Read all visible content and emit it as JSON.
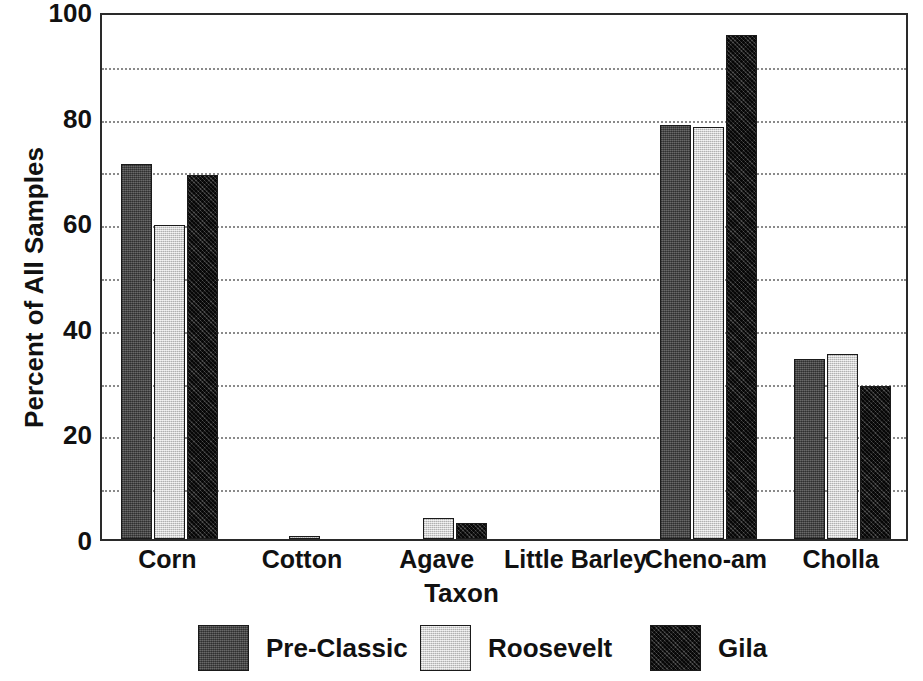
{
  "chart_data": {
    "type": "bar",
    "title": "",
    "xlabel": "Taxon",
    "ylabel": "Percent of All Samples",
    "ylim": [
      0,
      100
    ],
    "yticks": [
      0,
      20,
      40,
      60,
      80,
      100
    ],
    "ytick_labels": [
      "0",
      "20",
      "40",
      "60",
      "80",
      "100"
    ],
    "minor_gridlines": [
      10,
      30,
      50,
      70,
      90
    ],
    "grid": true,
    "grid_style": "dotted",
    "legend_position": "bottom",
    "categories": [
      "Corn",
      "Cotton",
      "Agave",
      "Little Barley",
      "Cheno-am",
      "Cholla"
    ],
    "series": [
      {
        "name": "Pre-Classic",
        "color": "#4a4a4a",
        "values": [
          71,
          0,
          0,
          0,
          78.5,
          34
        ]
      },
      {
        "name": "Roosevelt",
        "color": "#d2d2d2",
        "values": [
          59.5,
          0.5,
          4,
          0,
          78,
          35
        ]
      },
      {
        "name": "Gila",
        "color": "#1c1c1c",
        "values": [
          69,
          0,
          3,
          0,
          95.5,
          29
        ]
      }
    ]
  },
  "legend": {
    "items": [
      {
        "label": "Pre-Classic",
        "key": "preclassic"
      },
      {
        "label": "Roosevelt",
        "key": "roosevelt"
      },
      {
        "label": "Gila",
        "key": "gila"
      }
    ]
  }
}
